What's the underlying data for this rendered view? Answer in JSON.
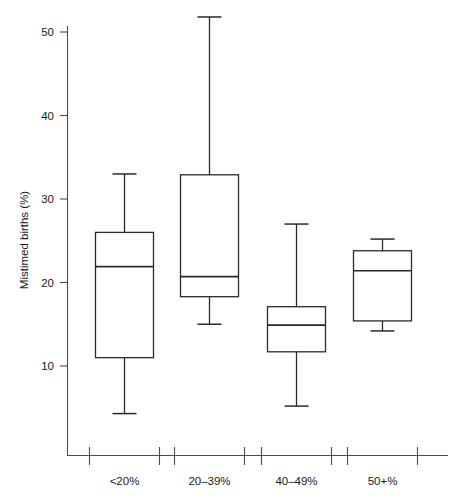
{
  "chart_data": {
    "type": "box",
    "title": "",
    "xlabel": "",
    "ylabel": "Mistimed births (%)",
    "categories": [
      "<20%",
      "20–39%",
      "40–49%",
      "50+%"
    ],
    "ylim": [
      0,
      54
    ],
    "yticks": [
      10,
      20,
      30,
      40,
      50
    ],
    "ytick_labels": [
      "10",
      "20",
      "30",
      "40",
      "50"
    ],
    "grid": false,
    "legend": "none",
    "boxes": [
      {
        "category": "<20%",
        "min": 4.3,
        "q1": 11.0,
        "median": 21.9,
        "q3": 26.0,
        "max": 33.0
      },
      {
        "category": "20–39%",
        "min": 15.0,
        "q1": 18.3,
        "median": 20.7,
        "q3": 32.9,
        "max": 51.8
      },
      {
        "category": "40–49%",
        "min": 5.2,
        "q1": 11.7,
        "median": 14.9,
        "q3": 17.1,
        "max": 27.0
      },
      {
        "category": "50+%",
        "min": 14.2,
        "q1": 15.4,
        "median": 21.4,
        "q3": 23.8,
        "max": 25.2
      }
    ]
  },
  "axis": {
    "y_title": "Mistimed births (%)",
    "y_tick_labels": [
      "50",
      "40",
      "30",
      "20",
      "10"
    ],
    "x_tick_labels": [
      "<20%",
      "20–39%",
      "40–49%",
      "50+%"
    ]
  },
  "colors": {
    "stroke": "#2a2a2a",
    "axis": "#4a4a4a",
    "background": "#ffffff"
  }
}
